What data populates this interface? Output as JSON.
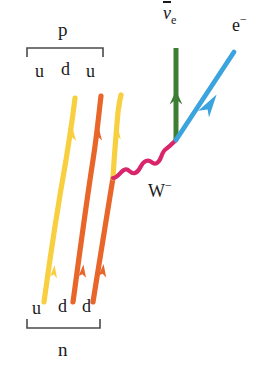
{
  "figure": {
    "type": "feynman-diagram",
    "background_color": "#ffffff"
  },
  "labels": {
    "proton": "p",
    "neutron": "n",
    "proton_quarks": [
      "u",
      "d",
      "u"
    ],
    "neutron_quarks": [
      "u",
      "d",
      "d"
    ],
    "w_boson": "W",
    "w_boson_charge": "−",
    "antineutrino_symbol": "ν",
    "antineutrino_subscript": "e",
    "electron": "e",
    "electron_charge": "−"
  },
  "colors": {
    "up_quark": "#f7cf3f",
    "down_quark": "#e8662a",
    "w_boson": "#d8256b",
    "antineutrino": "#3f7d34",
    "electron": "#3ba3dd",
    "bracket": "#4a4a4a",
    "text": "#1a1a1a"
  },
  "particles": [
    {
      "name": "up-quark-left",
      "color_key": "up_quark",
      "flavor": "u",
      "direction": "upward"
    },
    {
      "name": "down-quark-middle",
      "color_key": "down_quark",
      "flavor": "d",
      "direction": "upward"
    },
    {
      "name": "down-to-up-quark-right",
      "color_key": "down_quark",
      "flavor": "d→u",
      "direction": "upward"
    },
    {
      "name": "w-minus-boson",
      "color_key": "w_boson",
      "flavor": "W−",
      "direction": "emitted"
    },
    {
      "name": "electron-antineutrino",
      "color_key": "antineutrino",
      "flavor": "ν̄e",
      "direction": "upward"
    },
    {
      "name": "electron",
      "color_key": "electron",
      "flavor": "e−",
      "direction": "up-right"
    }
  ],
  "geometry": {
    "vertex_w_quark": [
      113,
      178
    ],
    "vertex_w_leptons": [
      176,
      140
    ],
    "top_bracket": {
      "x1": 27,
      "x2": 103,
      "y": 48
    },
    "bottom_bracket": {
      "x1": 27,
      "x2": 100,
      "y": 328
    }
  }
}
